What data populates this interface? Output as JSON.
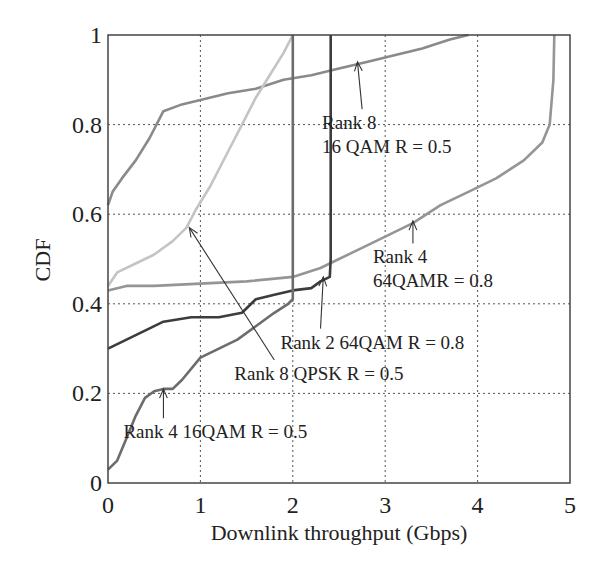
{
  "chart_data": {
    "type": "line",
    "title": "",
    "xlabel": "Downlink throughput (Gbps)",
    "ylabel": "CDF",
    "xlim": [
      0,
      5
    ],
    "ylim": [
      0,
      1
    ],
    "xticks": [
      "0",
      "1",
      "2",
      "3",
      "4",
      "5"
    ],
    "yticks": [
      "0",
      "0.2",
      "0.4",
      "0.6",
      "0.8",
      "1"
    ],
    "grid": true,
    "legend": "none (inline annotations)",
    "series": [
      {
        "name": "Rank 8 16 QAM R = 0.5",
        "color": "#8a8a8a",
        "x": [
          0,
          0.05,
          0.15,
          0.3,
          0.45,
          0.55,
          0.6,
          0.8,
          1.0,
          1.3,
          1.6,
          1.9,
          2.2,
          2.5,
          2.8,
          3.1,
          3.4,
          3.7,
          3.9
        ],
        "y": [
          0.62,
          0.65,
          0.68,
          0.72,
          0.77,
          0.81,
          0.83,
          0.845,
          0.855,
          0.87,
          0.88,
          0.9,
          0.91,
          0.925,
          0.94,
          0.955,
          0.97,
          0.99,
          1.0
        ]
      },
      {
        "name": "Rank 8 QPSK R = 0.5",
        "color": "#c4c4c4",
        "x": [
          0,
          0.1,
          0.3,
          0.5,
          0.7,
          0.85,
          0.95,
          1.1,
          1.3,
          1.45,
          1.6,
          1.75,
          1.9,
          2.0
        ],
        "y": [
          0.44,
          0.47,
          0.49,
          0.51,
          0.54,
          0.57,
          0.61,
          0.66,
          0.74,
          0.8,
          0.86,
          0.91,
          0.96,
          1.0
        ]
      },
      {
        "name": "Rank 4 64QAMR = 0.8",
        "color": "#959595",
        "x": [
          0,
          0.2,
          0.5,
          1.0,
          1.5,
          2.0,
          2.3,
          2.5,
          2.8,
          3.0,
          3.3,
          3.6,
          3.9,
          4.2,
          4.5,
          4.7,
          4.78,
          4.82,
          4.83
        ],
        "y": [
          0.43,
          0.44,
          0.44,
          0.445,
          0.45,
          0.46,
          0.48,
          0.5,
          0.53,
          0.55,
          0.58,
          0.62,
          0.65,
          0.68,
          0.72,
          0.76,
          0.8,
          0.9,
          1.0
        ]
      },
      {
        "name": "Rank 2 64QAM R = 0.8",
        "color": "#3c3c3c",
        "x": [
          0,
          0.2,
          0.4,
          0.6,
          0.9,
          1.2,
          1.45,
          1.6,
          1.8,
          2.0,
          2.2,
          2.3,
          2.4,
          2.41,
          2.41
        ],
        "y": [
          0.3,
          0.32,
          0.34,
          0.36,
          0.37,
          0.37,
          0.38,
          0.41,
          0.42,
          0.43,
          0.435,
          0.45,
          0.46,
          0.5,
          1.0
        ]
      },
      {
        "name": "Rank 4 16QAM R = 0.5",
        "color": "#6c6c6c",
        "x": [
          0,
          0.1,
          0.2,
          0.3,
          0.4,
          0.5,
          0.6,
          0.7,
          0.8,
          1.0,
          1.2,
          1.4,
          1.6,
          1.8,
          1.95,
          2.0,
          2.0
        ],
        "y": [
          0.03,
          0.05,
          0.1,
          0.15,
          0.19,
          0.205,
          0.21,
          0.21,
          0.23,
          0.28,
          0.3,
          0.32,
          0.35,
          0.38,
          0.4,
          0.41,
          1.0
        ]
      }
    ],
    "annotations": [
      {
        "text_lines": [
          "Rank 8",
          "16 QAM R = 0.5"
        ],
        "series": "Rank 8 16QAM",
        "arrow_to": [
          2.7,
          0.94
        ],
        "text_at": [
          2.75,
          0.79
        ]
      },
      {
        "text_lines": [
          "Rank 4",
          "64QAMR = 0.8"
        ],
        "series": "Rank 4 64QAM",
        "arrow_to": [
          3.3,
          0.585
        ],
        "text_at": [
          3.3,
          0.49
        ]
      },
      {
        "text_lines": [
          "Rank 2 64QAM R = 0.8"
        ],
        "series": "Rank 2 64QAM",
        "arrow_to": [
          2.33,
          0.46
        ],
        "text_at": [
          2.3,
          0.3
        ]
      },
      {
        "text_lines": [
          "Rank 8 QPSK R = 0.5"
        ],
        "series": "Rank 8 QPSK",
        "arrow_to": [
          0.88,
          0.57
        ],
        "text_at": [
          1.8,
          0.23
        ]
      },
      {
        "text_lines": [
          "Rank 4 16QAM R = 0.5"
        ],
        "series": "Rank 4 16QAM",
        "arrow_to": [
          0.6,
          0.21
        ],
        "text_at": [
          0.6,
          0.1
        ]
      }
    ]
  }
}
